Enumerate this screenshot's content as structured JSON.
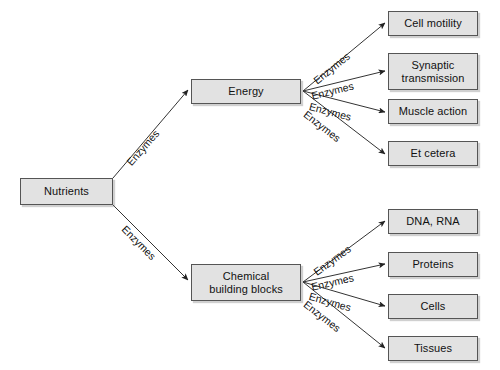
{
  "diagram": {
    "colors": {
      "node_fill": "#e2e2e2",
      "node_border": "#555555",
      "edge_stroke": "#333333",
      "text": "#111111",
      "background": "#ffffff"
    },
    "nodes": {
      "root": {
        "label": "Nutrients",
        "x": 20,
        "y": 178,
        "w": 93,
        "h": 27
      },
      "energy": {
        "label": "Energy",
        "x": 191,
        "y": 79,
        "w": 110,
        "h": 25
      },
      "building_blocks": {
        "label": "Chemical\nbuilding blocks",
        "x": 191,
        "y": 264,
        "w": 110,
        "h": 37
      },
      "leaves_top": [
        {
          "label": "Cell motility",
          "x": 388,
          "y": 11,
          "w": 90,
          "h": 25
        },
        {
          "label": "Synaptic\ntransmission",
          "x": 388,
          "y": 53,
          "w": 90,
          "h": 37
        },
        {
          "label": "Muscle action",
          "x": 388,
          "y": 99,
          "w": 90,
          "h": 25
        },
        {
          "label": "Et cetera",
          "x": 388,
          "y": 141,
          "w": 90,
          "h": 25
        }
      ],
      "leaves_bottom": [
        {
          "label": "DNA, RNA",
          "x": 388,
          "y": 209,
          "w": 90,
          "h": 25
        },
        {
          "label": "Proteins",
          "x": 388,
          "y": 252,
          "w": 90,
          "h": 25
        },
        {
          "label": "Cells",
          "x": 388,
          "y": 294,
          "w": 90,
          "h": 25
        },
        {
          "label": "Tissues",
          "x": 388,
          "y": 336,
          "w": 90,
          "h": 25
        }
      ]
    },
    "edge_labels": {
      "root_to_energy": "Enzymes",
      "root_to_building_blocks": "Enzymes",
      "energy_branch": [
        "Enzymes",
        "Enzymes",
        "Enzymes",
        "Enzymes"
      ],
      "building_blocks_branch": [
        "Enzymes",
        "Enzymes",
        "Enzymes",
        "Enzymes"
      ]
    },
    "edges": [
      {
        "name": "nutrients-to-energy",
        "x1": 113,
        "y1": 178,
        "x2": 188,
        "y2": 90
      },
      {
        "name": "nutrients-to-building-blocks",
        "x1": 113,
        "y1": 205,
        "x2": 188,
        "y2": 280
      },
      {
        "name": "energy-to-cell-motility",
        "x1": 303,
        "y1": 91,
        "x2": 385,
        "y2": 23
      },
      {
        "name": "energy-to-synaptic-transmission",
        "x1": 303,
        "y1": 91,
        "x2": 385,
        "y2": 71
      },
      {
        "name": "energy-to-muscle-action",
        "x1": 303,
        "y1": 91,
        "x2": 385,
        "y2": 112
      },
      {
        "name": "energy-to-et-cetera",
        "x1": 303,
        "y1": 91,
        "x2": 385,
        "y2": 154
      },
      {
        "name": "blocks-to-dna-rna",
        "x1": 303,
        "y1": 282,
        "x2": 385,
        "y2": 221
      },
      {
        "name": "blocks-to-proteins",
        "x1": 303,
        "y1": 282,
        "x2": 385,
        "y2": 264
      },
      {
        "name": "blocks-to-cells",
        "x1": 303,
        "y1": 282,
        "x2": 385,
        "y2": 306
      },
      {
        "name": "blocks-to-tissues",
        "x1": 303,
        "y1": 282,
        "x2": 385,
        "y2": 348
      }
    ],
    "label_positions": [
      {
        "name": "label-nutrients-energy",
        "x": 124,
        "y": 160,
        "rot": -49
      },
      {
        "name": "label-nutrients-blocks",
        "x": 128,
        "y": 223,
        "rot": 45
      },
      {
        "name": "label-energy-cell-motility",
        "x": 311,
        "y": 77,
        "rot": -39
      },
      {
        "name": "label-energy-synaptic",
        "x": 310,
        "y": 90,
        "rot": -14
      },
      {
        "name": "label-energy-muscle",
        "x": 311,
        "y": 100,
        "rot": 15
      },
      {
        "name": "label-energy-etcetera",
        "x": 309,
        "y": 108,
        "rot": 38
      },
      {
        "name": "label-blocks-dna",
        "x": 311,
        "y": 268,
        "rot": -36
      },
      {
        "name": "label-blocks-proteins",
        "x": 310,
        "y": 281,
        "rot": -13
      },
      {
        "name": "label-blocks-cells",
        "x": 311,
        "y": 290,
        "rot": 16
      },
      {
        "name": "label-blocks-tissues",
        "x": 309,
        "y": 298,
        "rot": 38
      }
    ]
  }
}
